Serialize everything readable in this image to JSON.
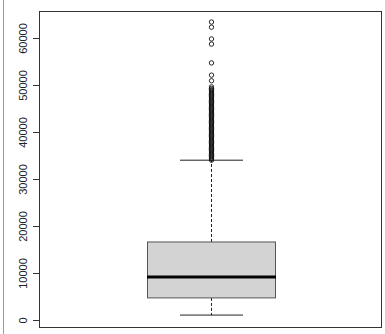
{
  "chart_data": {
    "type": "boxplot",
    "title": "",
    "xlabel": "",
    "ylabel": "",
    "ylim": [
      -1500,
      66000
    ],
    "yticks": [
      0,
      10000,
      20000,
      30000,
      40000,
      50000,
      60000
    ],
    "ytick_labels": [
      "0",
      "10000",
      "20000",
      "30000",
      "40000",
      "50000",
      "60000"
    ],
    "grid": false,
    "legend": null,
    "box": {
      "lower_whisker": 1050,
      "q1": 4700,
      "median": 9150,
      "q3": 16600,
      "upper_whisker": 34000,
      "fill_color": "#d3d3d3",
      "line_color": "#555555",
      "median_color": "#000000"
    },
    "outliers_sparse": [
      63400,
      62300,
      59800,
      58700,
      54700,
      52100,
      50900,
      49600
    ],
    "outliers_dense_range": [
      34000,
      49400
    ]
  },
  "plot": {
    "frame": {
      "left": 39,
      "top": 11,
      "right": 381,
      "bottom": 327
    },
    "y_zero_px": 320,
    "px_per_10000": 47,
    "box_x": {
      "left": 147,
      "right": 275,
      "center": 211
    },
    "cap_x": {
      "left": 180,
      "right": 243
    }
  }
}
